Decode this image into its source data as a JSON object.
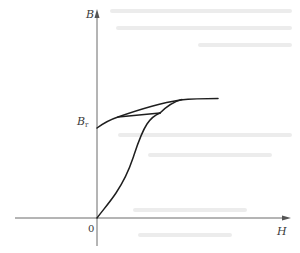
{
  "figure": {
    "kind": "magnetization-curve",
    "axes": {
      "y_label": "B",
      "x_label": "H",
      "origin_label": "0"
    },
    "annotations": {
      "remanence_label_main": "B",
      "remanence_label_sub": "r"
    },
    "curves": [
      {
        "name": "initial-magnetization-curve",
        "description": "rises from origin to saturation"
      },
      {
        "name": "upper-demagnetization-branch",
        "description": "from Br to saturation"
      },
      {
        "name": "minor-loop-lower-branch",
        "description": "from Br region to junction"
      },
      {
        "name": "minor-loop-return-branch",
        "description": "from junction back up to saturation"
      }
    ],
    "colors": {
      "curve": "#1e1e1e",
      "axis": "#6a6a6a",
      "text": "#3a3a3a"
    }
  }
}
